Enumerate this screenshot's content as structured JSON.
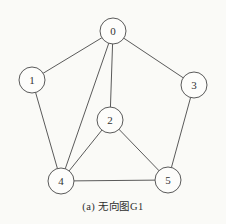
{
  "figure": {
    "caption": "(a) 无向图G1"
  },
  "chart_data": {
    "type": "graph",
    "graph_type": "undirected",
    "title": "(a) 无向图G1",
    "nodes": [
      {
        "id": "0",
        "x": 113,
        "y": 31
      },
      {
        "id": "1",
        "x": 32,
        "y": 80
      },
      {
        "id": "2",
        "x": 110,
        "y": 120
      },
      {
        "id": "3",
        "x": 194,
        "y": 85
      },
      {
        "id": "4",
        "x": 61,
        "y": 181
      },
      {
        "id": "5",
        "x": 168,
        "y": 180
      }
    ],
    "edges": [
      [
        "0",
        "1"
      ],
      [
        "0",
        "2"
      ],
      [
        "0",
        "3"
      ],
      [
        "0",
        "4"
      ],
      [
        "1",
        "4"
      ],
      [
        "2",
        "4"
      ],
      [
        "2",
        "5"
      ],
      [
        "3",
        "5"
      ],
      [
        "4",
        "5"
      ]
    ],
    "node_radius": 13,
    "colors": {
      "stroke": "#5a5a5a",
      "node_fill": "#fdfdfb",
      "label": "#333333",
      "background": "#fafaf7"
    }
  }
}
